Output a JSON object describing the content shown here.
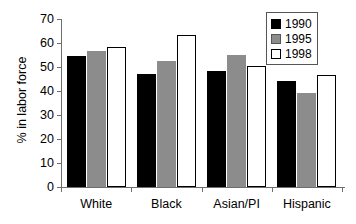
{
  "chart_data": {
    "type": "bar",
    "title": "",
    "subtitle": "",
    "xlabel": "",
    "ylabel": "% in labor force",
    "categories": [
      "White",
      "Black",
      "Asian/PI",
      "Hispanic"
    ],
    "series": [
      {
        "name": "1990",
        "color": "#000000",
        "values": [
          54.5,
          47.0,
          48.5,
          44.0
        ]
      },
      {
        "name": "1995",
        "color": "#8c8c8c",
        "values": [
          56.5,
          52.5,
          55.0,
          39.0
        ]
      },
      {
        "name": "1998",
        "color": "#ffffff",
        "values": [
          58.5,
          63.5,
          50.5,
          46.5
        ]
      }
    ],
    "ylim": [
      0,
      70
    ],
    "ytick_values": [
      0,
      10,
      20,
      30,
      40,
      50,
      60,
      70
    ],
    "ytick_labels": [
      "0",
      "10",
      "20",
      "30",
      "40",
      "50",
      "60",
      "70"
    ],
    "grid": false,
    "legend_position": "top-right",
    "legend_entries": [
      "1990",
      "1995",
      "1998"
    ]
  },
  "axis": {
    "y_title": "% in labor force",
    "ticks": [
      "70",
      "60",
      "50",
      "40",
      "30",
      "20",
      "10",
      "0"
    ]
  },
  "categories": {
    "c0": "White",
    "c1": "Black",
    "c2": "Asian/PI",
    "c3": "Hispanic"
  },
  "legend": {
    "items": [
      {
        "label": "1990"
      },
      {
        "label": "1995"
      },
      {
        "label": "1998"
      }
    ]
  }
}
